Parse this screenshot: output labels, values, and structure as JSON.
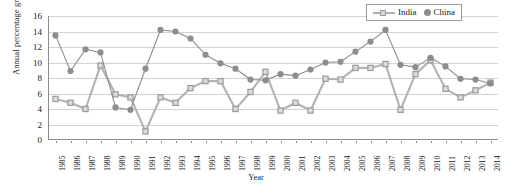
{
  "chart_data": {
    "type": "line",
    "title": "",
    "xlabel": "Year",
    "ylabel": "Annual percentage growth rate",
    "ylim": [
      0,
      16
    ],
    "yticks": [
      0,
      2,
      4,
      6,
      8,
      10,
      12,
      14,
      16
    ],
    "grid": true,
    "legend_position": "top-right",
    "categories": [
      "1985",
      "1986",
      "1987",
      "1988",
      "1989",
      "1990",
      "1991",
      "1992",
      "1993",
      "1994",
      "1995",
      "1996",
      "1997",
      "1998",
      "1999",
      "2000",
      "2001",
      "2002",
      "2003",
      "2004",
      "2005",
      "2006",
      "2007",
      "2008",
      "2009",
      "2010",
      "2011",
      "2012",
      "2013",
      "2014"
    ],
    "series": [
      {
        "name": "India",
        "marker": "square",
        "color": "#b3b3b3",
        "values": [
          5.3,
          4.8,
          4.0,
          9.6,
          5.9,
          5.5,
          1.1,
          5.5,
          4.8,
          6.7,
          7.6,
          7.6,
          4.0,
          6.2,
          8.8,
          3.8,
          4.8,
          3.8,
          7.9,
          7.8,
          9.3,
          9.3,
          9.8,
          3.9,
          8.5,
          10.3,
          6.6,
          5.5,
          6.4,
          7.4
        ]
      },
      {
        "name": "China",
        "marker": "circle",
        "color": "#8d8d8d",
        "values": [
          13.5,
          8.9,
          11.7,
          11.3,
          4.2,
          3.9,
          9.2,
          14.2,
          14.0,
          13.1,
          11.0,
          9.9,
          9.2,
          7.8,
          7.7,
          8.5,
          8.3,
          9.1,
          10.0,
          10.1,
          11.4,
          12.7,
          14.2,
          9.7,
          9.4,
          10.6,
          9.5,
          7.9,
          7.8,
          7.3
        ]
      }
    ]
  },
  "legend": {
    "items": [
      {
        "label": "India"
      },
      {
        "label": "China"
      }
    ]
  },
  "axes": {
    "x_title": "Year",
    "y_title": "Annual percentage growth rate"
  }
}
